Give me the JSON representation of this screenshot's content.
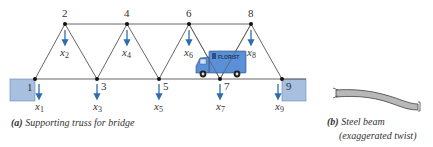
{
  "figure_a": {
    "caption_letter": "(a)",
    "caption_text": "Supporting truss for bridge",
    "nodes": [
      {
        "id": "1",
        "x": 35,
        "y": 79
      },
      {
        "id": "2",
        "x": 65,
        "y": 24
      },
      {
        "id": "3",
        "x": 97,
        "y": 79
      },
      {
        "id": "4",
        "x": 127,
        "y": 24
      },
      {
        "id": "5",
        "x": 159,
        "y": 79
      },
      {
        "id": "6",
        "x": 189,
        "y": 24
      },
      {
        "id": "7",
        "x": 220,
        "y": 79
      },
      {
        "id": "8",
        "x": 251,
        "y": 24
      },
      {
        "id": "9",
        "x": 282,
        "y": 79
      }
    ],
    "displacement_labels": [
      {
        "base": "x",
        "sub": "1"
      },
      {
        "base": "x",
        "sub": "2"
      },
      {
        "base": "x",
        "sub": "3"
      },
      {
        "base": "x",
        "sub": "4"
      },
      {
        "base": "x",
        "sub": "5"
      },
      {
        "base": "x",
        "sub": "6"
      },
      {
        "base": "x",
        "sub": "7"
      },
      {
        "base": "x",
        "sub": "8"
      },
      {
        "base": "x",
        "sub": "9"
      }
    ],
    "truck_label": "FLORIST",
    "colors": {
      "arrow": "#2e6db4",
      "support": "#a9bfe0",
      "truck": "#5b8fd6",
      "member": "#555555"
    }
  },
  "figure_b": {
    "caption_letter": "(b)",
    "caption_line1": "Steel beam",
    "caption_line2": "(exaggerated twist)"
  }
}
